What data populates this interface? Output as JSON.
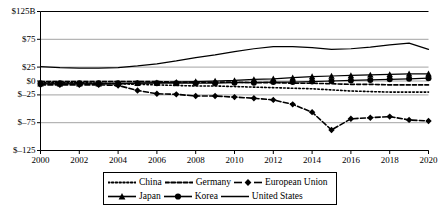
{
  "chart_data": {
    "type": "line",
    "title": "",
    "xlabel": "",
    "ylabel": "",
    "x": [
      2000,
      2001,
      2002,
      2003,
      2004,
      2005,
      2006,
      2007,
      2008,
      2009,
      2010,
      2011,
      2012,
      2013,
      2014,
      2015,
      2016,
      2017,
      2018,
      2019,
      2020
    ],
    "xtick_labels": [
      "2000",
      "2002",
      "2004",
      "2006",
      "2008",
      "2010",
      "2012",
      "2014",
      "2016",
      "2018",
      "2020"
    ],
    "xticks": [
      2000,
      2002,
      2004,
      2006,
      2008,
      2010,
      2012,
      2014,
      2016,
      2018,
      2020
    ],
    "xlim": [
      2000,
      2020
    ],
    "ytick_labels": [
      "$125B",
      "$75",
      "$25",
      "$0",
      "$–25",
      "$–75",
      "$–125"
    ],
    "yticks": [
      125,
      75,
      25,
      0,
      -25,
      -75,
      -125
    ],
    "ylim": [
      -125,
      125
    ],
    "grid": "horizontal",
    "legend_position": "bottom",
    "series": [
      {
        "name": "China",
        "style": "dotted",
        "marker": "none",
        "color": "#000000",
        "values": [
          -3,
          -3,
          -3,
          -4,
          -5,
          -6,
          -7,
          -8,
          -9,
          -9,
          -10,
          -11,
          -12,
          -13,
          -14,
          -16,
          -18,
          -19,
          -20,
          -20,
          -20
        ]
      },
      {
        "name": "Germany",
        "style": "dashed",
        "marker": "none",
        "color": "#000000",
        "values": [
          -1,
          -1,
          -1,
          -1,
          -1,
          -1,
          -1,
          -2,
          -2,
          -2,
          -2,
          -3,
          -3,
          -4,
          -4,
          -5,
          -6,
          -6,
          -7,
          -7,
          -7
        ]
      },
      {
        "name": "European Union",
        "style": "dash-dot",
        "marker": "diamond",
        "color": "#000000",
        "values": [
          -7,
          -7,
          -7,
          -7,
          -8,
          -17,
          -23,
          -24,
          -27,
          -27,
          -29,
          -31,
          -34,
          -42,
          -56,
          -88,
          -68,
          -66,
          -64,
          -70,
          -72
        ]
      },
      {
        "name": "Japan",
        "style": "solid",
        "marker": "triangle",
        "color": "#000000",
        "values": [
          -5,
          -5,
          -5,
          -5,
          -5,
          -4,
          -3,
          -2,
          -1,
          0,
          1,
          3,
          4,
          6,
          8,
          9,
          10,
          11,
          12,
          13,
          13
        ]
      },
      {
        "name": "Korea",
        "style": "solid",
        "marker": "circle",
        "color": "#000000",
        "values": [
          -4,
          -4,
          -4,
          -4,
          -4,
          -4,
          -4,
          -4,
          -4,
          -4,
          -3,
          -3,
          -2,
          -2,
          -1,
          0,
          1,
          2,
          3,
          4,
          5
        ]
      },
      {
        "name": "United States",
        "style": "solid",
        "marker": "none",
        "color": "#000000",
        "values": [
          26,
          24,
          23,
          23,
          24,
          27,
          31,
          36,
          42,
          47,
          53,
          58,
          62,
          62,
          60,
          57,
          58,
          61,
          65,
          68,
          57
        ]
      }
    ]
  },
  "legend": {
    "rows": [
      [
        {
          "label": "China",
          "style": "dotted",
          "marker": "none"
        },
        {
          "label": "Germany",
          "style": "dashed",
          "marker": "none"
        },
        {
          "label": "European Union",
          "style": "dash-dot",
          "marker": "diamond"
        }
      ],
      [
        {
          "label": "Japan",
          "style": "solid",
          "marker": "triangle"
        },
        {
          "label": "Korea",
          "style": "solid",
          "marker": "circle"
        },
        {
          "label": "United States",
          "style": "solid",
          "marker": "none"
        }
      ]
    ]
  },
  "colors": {
    "axis": "#000000",
    "grid": "#8c8c8c",
    "background": "#ffffff",
    "series": "#000000"
  }
}
